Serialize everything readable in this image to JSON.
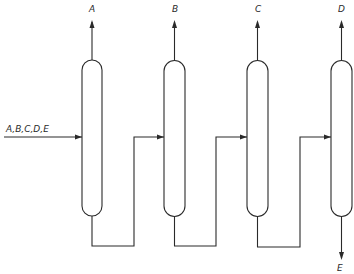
{
  "diagram": {
    "type": "distillation-column-sequence",
    "feed": {
      "label": "A,B,C,D,E"
    },
    "columns": [
      {
        "id": "column-1",
        "top_product": "A"
      },
      {
        "id": "column-2",
        "top_product": "B"
      },
      {
        "id": "column-3",
        "top_product": "C"
      },
      {
        "id": "column-4",
        "top_product": "D",
        "bottom_product": "E"
      }
    ],
    "colors": {
      "stroke": "#2a2a2a",
      "background": "#ffffff"
    }
  }
}
